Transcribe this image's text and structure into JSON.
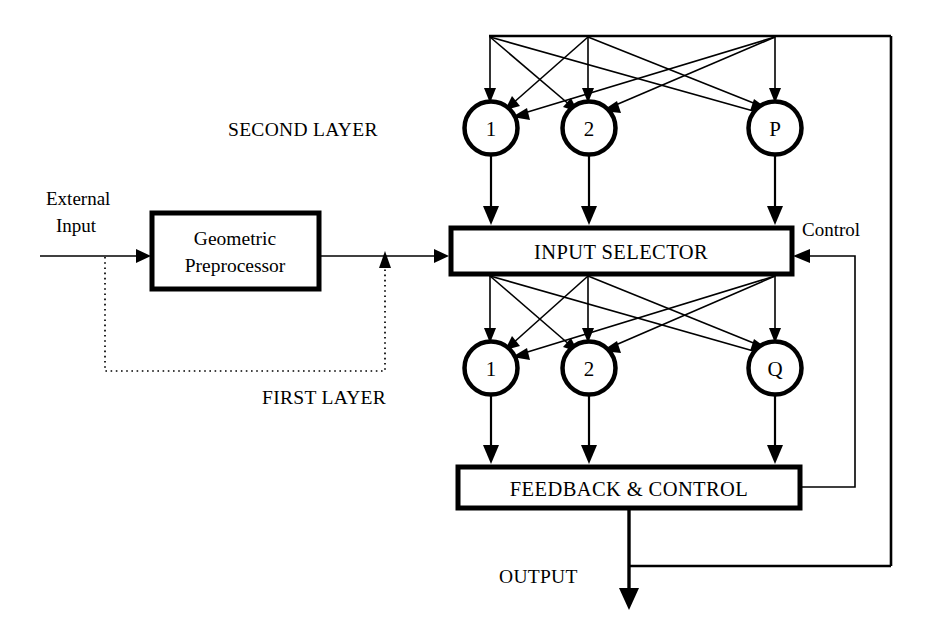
{
  "diagram": {
    "background_color": "#ffffff",
    "line_color": "#000000",
    "blocks": [
      {
        "id": "geometric-preprocessor",
        "label_line1": "Geometric",
        "label_line2": "Preprocessor"
      },
      {
        "id": "input-selector",
        "label": "INPUT SELECTOR"
      },
      {
        "id": "feedback-control",
        "label": "FEEDBACK & CONTROL"
      }
    ],
    "second_layer": {
      "label": "SECOND LAYER",
      "nodes": [
        {
          "label": "1"
        },
        {
          "label": "2"
        },
        {
          "label": "P"
        }
      ]
    },
    "first_layer": {
      "label": "FIRST LAYER",
      "nodes": [
        {
          "label": "1"
        },
        {
          "label": "2"
        },
        {
          "label": "Q"
        }
      ]
    },
    "signals": {
      "external_input_line1": "External",
      "external_input_line2": "Input",
      "control": "Control",
      "output": "OUTPUT"
    }
  }
}
